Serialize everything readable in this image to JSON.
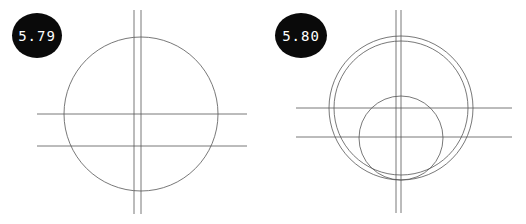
{
  "figures": [
    {
      "label": "5.79",
      "badge": {
        "x": 12,
        "y": 13,
        "w": 50,
        "h": 45
      },
      "circles": [
        {
          "cx": 141,
          "cy": 114,
          "r": 77
        }
      ],
      "vertical_lines": [
        134,
        141
      ],
      "vertical_range": [
        10,
        214
      ],
      "horizontal_lines": [
        114,
        146
      ],
      "horizontal_range": [
        37,
        247
      ]
    },
    {
      "label": "5.80",
      "badge": {
        "x": 275,
        "y": 13,
        "w": 52,
        "h": 45
      },
      "circles": [
        {
          "cx": 401,
          "cy": 108,
          "r": 72
        },
        {
          "cx": 401,
          "cy": 108,
          "r": 67
        },
        {
          "cx": 401,
          "cy": 138,
          "r": 42
        }
      ],
      "vertical_lines": [
        396,
        401
      ],
      "vertical_range": [
        10,
        213
      ],
      "horizontal_lines": [
        108,
        137
      ],
      "horizontal_range": [
        296,
        512
      ]
    }
  ],
  "colors": {
    "stroke": "#555555",
    "badge_bg": "#0a0a0a",
    "badge_text": "#ffffff"
  }
}
